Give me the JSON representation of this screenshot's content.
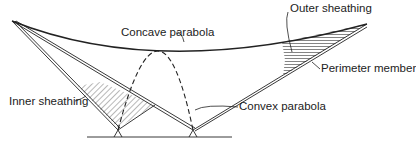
{
  "diagram": {
    "labels": {
      "concave": "Concave parabola",
      "outer": "Outer sheathing",
      "perimeter": "Perimeter member",
      "inner": "Inner sheathing",
      "convex": "Convex parabola"
    },
    "colors": {
      "line": "#222222",
      "background": "#ffffff"
    }
  }
}
